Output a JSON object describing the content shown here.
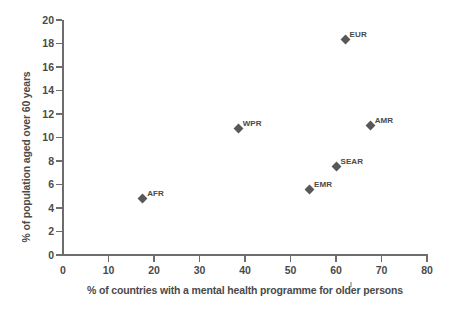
{
  "chart_data": {
    "type": "scatter",
    "title": "",
    "xlabel": "% of countries with a mental health programme for older persons",
    "ylabel": "% of population aged over 60 years",
    "xlim": [
      0,
      80
    ],
    "ylim": [
      0,
      20
    ],
    "xticks": [
      0,
      10,
      20,
      30,
      40,
      50,
      60,
      70,
      80
    ],
    "yticks": [
      0,
      2,
      4,
      6,
      8,
      10,
      12,
      14,
      16,
      18,
      20
    ],
    "grid": false,
    "legend": "none",
    "marker": "diamond",
    "marker_color": "#585858",
    "points": [
      {
        "label": "AFR",
        "x": 17.5,
        "y": 4.8
      },
      {
        "label": "WPR",
        "x": 38.5,
        "y": 10.8
      },
      {
        "label": "EMR",
        "x": 54.2,
        "y": 5.6
      },
      {
        "label": "SEAR",
        "x": 60.0,
        "y": 7.5
      },
      {
        "label": "EUR",
        "x": 62.0,
        "y": 18.3
      },
      {
        "label": "AMR",
        "x": 67.5,
        "y": 11.0
      }
    ]
  },
  "axis": {
    "x_tick_labels": [
      "0",
      "10",
      "20",
      "30",
      "40",
      "50",
      "60",
      "70",
      "80"
    ],
    "y_tick_labels": [
      "0",
      "2",
      "4",
      "6",
      "8",
      "10",
      "12",
      "14",
      "16",
      "18",
      "20"
    ],
    "x_title": "% of countries with a mental health programme for older persons",
    "y_title": "% of population aged over 60 years"
  },
  "colors": {
    "marker": "#585858",
    "axis": "#6d6d6d",
    "text": "#4a4a4a",
    "background": "#ffffff"
  }
}
